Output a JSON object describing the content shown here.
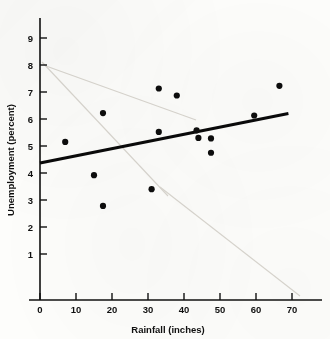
{
  "chart_data": {
    "type": "scatter",
    "title": "",
    "xlabel": "Rainfall (inches)",
    "ylabel": "Unemployment (percent)",
    "xlim": [
      0,
      74
    ],
    "ylim": [
      0,
      9.6
    ],
    "xticks": [
      0,
      10,
      20,
      30,
      40,
      50,
      60,
      70
    ],
    "yticks": [
      1,
      2,
      3,
      4,
      5,
      6,
      7,
      8,
      9
    ],
    "xtick_labels": [
      "0",
      "10",
      "20",
      "30",
      "40",
      "50",
      "60",
      "70"
    ],
    "ytick_labels": [
      "1",
      "2",
      "3",
      "4",
      "5",
      "6",
      "7",
      "8",
      "9"
    ],
    "grid": false,
    "legend": null,
    "points": [
      {
        "x": 7.0,
        "y": 5.15
      },
      {
        "x": 15.0,
        "y": 3.92
      },
      {
        "x": 17.5,
        "y": 6.22
      },
      {
        "x": 17.5,
        "y": 2.78
      },
      {
        "x": 31.0,
        "y": 3.4
      },
      {
        "x": 33.0,
        "y": 7.13
      },
      {
        "x": 33.0,
        "y": 5.52
      },
      {
        "x": 38.0,
        "y": 6.87
      },
      {
        "x": 43.5,
        "y": 5.58
      },
      {
        "x": 44.0,
        "y": 5.3
      },
      {
        "x": 47.5,
        "y": 5.28
      },
      {
        "x": 47.5,
        "y": 4.75
      },
      {
        "x": 59.5,
        "y": 6.13
      },
      {
        "x": 66.5,
        "y": 7.23
      }
    ],
    "fit_line": {
      "label": "least-squares regression line",
      "x_start": 0,
      "y_start": 4.37,
      "x_end": 69.0,
      "y_end": 6.2
    },
    "colors": {
      "point": "#0d0d0d",
      "line": "#0a0a0a",
      "axis": "#101010",
      "background": "#fdfdfb"
    }
  }
}
